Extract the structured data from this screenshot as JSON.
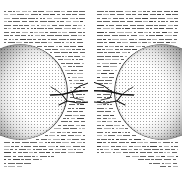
{
  "document": {
    "kind": "scanned-book-spread",
    "page_count_visible": 2,
    "background_color": "#ffffff",
    "ink_color": "#3a3a3a"
  },
  "pages": [
    {
      "id": "left",
      "side": "verso",
      "folio": "",
      "figure": {
        "name": "stippled-sphere-with-branch",
        "sphere": {
          "shape": "circle",
          "rendering": "stipple-halftone",
          "shading": "dark at outer-left rim, light toward inner-right",
          "cropped_at": "left-margin",
          "diameter_px": 96,
          "center_x_px": 20,
          "center_y_px": 92,
          "darkest_color": "#1c1c1c",
          "lightest_color": "#f2f2f2"
        },
        "branch": {
          "name": "branching-filament",
          "direction": "extends-right",
          "node_count": 3,
          "stroke_color": "#141414"
        }
      },
      "text": {
        "style": "greeked",
        "legible": false,
        "wraps_around_figure": true,
        "line_count": 46,
        "column_width_px": 82
      }
    },
    {
      "id": "right",
      "side": "recto",
      "folio": "",
      "figure": {
        "name": "stippled-sphere-with-branch",
        "sphere": {
          "shape": "circle",
          "rendering": "stipple-halftone",
          "shading": "dark at outer-right rim, light toward inner-left",
          "cropped_at": "right-margin",
          "diameter_px": 96,
          "center_x_px": 68,
          "center_y_px": 92,
          "darkest_color": "#1c1c1c",
          "lightest_color": "#f2f2f2"
        },
        "branch": {
          "name": "branching-filament",
          "direction": "extends-left",
          "node_count": 3,
          "stroke_color": "#141414"
        }
      },
      "text": {
        "style": "greeked",
        "legible": false,
        "wraps_around_figure": true,
        "line_count": 46,
        "column_width_px": 82
      }
    }
  ],
  "gutter": {
    "name": "page-gutter",
    "x_px": 88,
    "width_px": 6,
    "color": "#ffffff"
  }
}
